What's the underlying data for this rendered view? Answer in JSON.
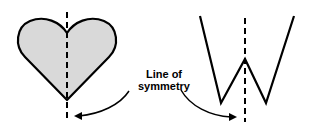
{
  "diagram": {
    "label_line1": "Line of",
    "label_line2": "symmetry",
    "shapes": [
      "heart",
      "w-shape"
    ],
    "colors": {
      "heart_fill": "#d9d9d9",
      "stroke": "#000000"
    }
  }
}
